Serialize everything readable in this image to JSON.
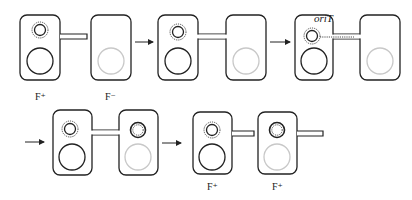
{
  "figure": {
    "colors": {
      "stroke": "#222222",
      "recipient_chromosome": "#c8c8c8",
      "background": "#ffffff"
    }
  },
  "labels": {
    "donor_initial": "F⁺",
    "recipient_initial": "F⁻",
    "origin_of_transfer": "oriT",
    "donor_final": "F⁺",
    "recipient_final": "F⁺"
  },
  "stages": [
    {
      "step": 1,
      "description": "F+ donor extends pilus toward F- recipient"
    },
    {
      "step": 2,
      "description": "Cells joined by conjugation bridge"
    },
    {
      "step": 3,
      "description": "Single strand nicked at oriT transfers through bridge"
    },
    {
      "step": 4,
      "description": "Complementary strands synthesized in both cells"
    },
    {
      "step": 5,
      "description": "Cells separate, both now F+"
    }
  ]
}
